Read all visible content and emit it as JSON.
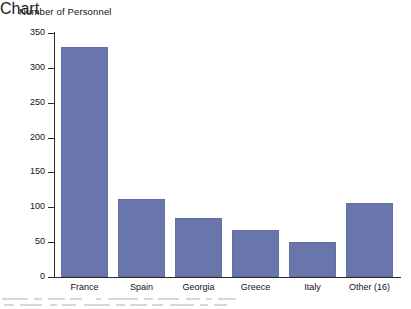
{
  "chart_data": {
    "type": "bar",
    "title": "Number of Personnel",
    "xlabel": "",
    "ylabel": "",
    "ylim": [
      0,
      350
    ],
    "yticks": [
      0,
      50,
      100,
      150,
      200,
      250,
      300,
      350
    ],
    "grid": false,
    "legend": null,
    "categories": [
      "France",
      "Spain",
      "Georgia",
      "Greece",
      "Italy",
      "Other (16)"
    ],
    "values": [
      330,
      112,
      85,
      68,
      50,
      106
    ],
    "bar_color": "#6a76ab",
    "axis_color": "#2b2b2b",
    "background": "#ffffff"
  },
  "axis": {
    "ticks": [
      {
        "label": "350",
        "value": 350
      },
      {
        "label": "300",
        "value": 300
      },
      {
        "label": "250",
        "value": 250
      },
      {
        "label": "200",
        "value": 200
      },
      {
        "label": "150",
        "value": 150
      },
      {
        "label": "100",
        "value": 100
      },
      {
        "label": "50",
        "value": 50
      },
      {
        "label": "0",
        "value": 0
      }
    ]
  },
  "bars": [
    {
      "label": "France",
      "value": 330
    },
    {
      "label": "Spain",
      "value": 112
    },
    {
      "label": "Georgia",
      "value": 85
    },
    {
      "label": "Greece",
      "value": 68
    },
    {
      "label": "Italy",
      "value": 50
    },
    {
      "label": "Other (16)",
      "value": 106
    }
  ]
}
